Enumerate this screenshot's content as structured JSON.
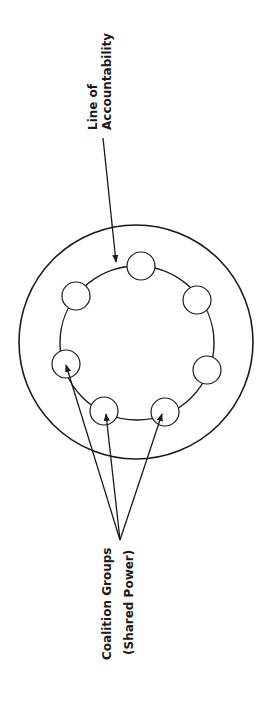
{
  "diagram": {
    "labels": {
      "accountability_line1": "Line of",
      "accountability_line2": "Accountability",
      "coalition_line1": "Coalition Groups",
      "coalition_line2": "(Shared Power)"
    },
    "outer_circle": {
      "cx": 136,
      "cy": 342,
      "r": 117
    },
    "inner_circle": {
      "cx": 137,
      "cy": 343,
      "r": 77
    },
    "coalition_nodes": [
      {
        "id": "top",
        "cx": 141,
        "cy": 266
      },
      {
        "id": "upper-left",
        "cx": 76,
        "cy": 296
      },
      {
        "id": "upper-right",
        "cx": 197,
        "cy": 300
      },
      {
        "id": "left",
        "cx": 66,
        "cy": 364
      },
      {
        "id": "right",
        "cx": 207,
        "cy": 370
      },
      {
        "id": "bottom-left",
        "cx": 104,
        "cy": 411
      },
      {
        "id": "bottom-right",
        "cx": 165,
        "cy": 412
      }
    ],
    "colors": {
      "stroke": "#1a1a1a",
      "background": "#ffffff"
    }
  }
}
